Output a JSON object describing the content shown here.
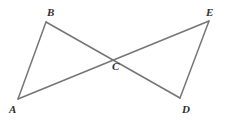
{
  "figure": {
    "canvas": {
      "width": 227,
      "height": 122
    },
    "background_color": "#ffffff",
    "line_color": "#757575",
    "line_width": 1.5,
    "label_color": "#2e2e2e",
    "points": {
      "A": {
        "label": "A",
        "x": 18,
        "y": 99,
        "label_x": 9,
        "label_y": 104
      },
      "B": {
        "label": "B",
        "x": 46,
        "y": 22,
        "label_x": 47,
        "label_y": 7
      },
      "C": {
        "label": "C",
        "x": 113,
        "y": 57,
        "label_x": 112,
        "label_y": 61
      },
      "D": {
        "label": "D",
        "x": 180,
        "y": 98,
        "label_x": 182,
        "label_y": 104
      },
      "E": {
        "label": "E",
        "x": 209,
        "y": 21,
        "label_x": 206,
        "label_y": 7
      }
    },
    "segments": [
      {
        "name": "segment-AB",
        "from": "A",
        "to": "B",
        "x1": 18,
        "y1": 99,
        "x2": 46,
        "y2": 22
      },
      {
        "name": "segment-AE",
        "from": "A",
        "to": "E",
        "x1": 18,
        "y1": 99,
        "x2": 209,
        "y2": 21
      },
      {
        "name": "segment-BD",
        "from": "B",
        "to": "D",
        "x1": 46,
        "y1": 22,
        "x2": 180,
        "y2": 98
      },
      {
        "name": "segment-DE",
        "from": "D",
        "to": "E",
        "x1": 180,
        "y1": 98,
        "x2": 209,
        "y2": 21
      }
    ]
  }
}
